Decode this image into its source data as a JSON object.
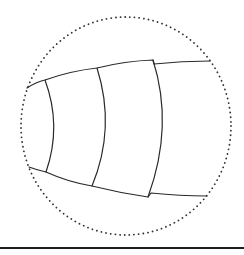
{
  "figure": {
    "stroke_color": "#2a2a2a",
    "dotted_color": "#333333",
    "background": "#ffffff",
    "magnifier_circle": {
      "cx": 126,
      "cy": 126,
      "rx": 105,
      "ry": 109,
      "style": "dotted"
    },
    "segments": [
      {
        "id": 1,
        "top_joint": [
          45,
          80
        ],
        "bottom_joint": [
          46,
          172
        ],
        "bulge_x": 55
      },
      {
        "id": 2,
        "top_joint": [
          97,
          68
        ],
        "bottom_joint": [
          92,
          186
        ],
        "bulge_x": 106
      },
      {
        "id": 3,
        "top_joint": [
          153,
          60
        ],
        "bottom_joint": [
          148,
          197
        ],
        "bulge_x": 163
      }
    ],
    "outline": {
      "top_start": [
        27,
        88
      ],
      "top_end": [
        210,
        61
      ],
      "bottom_start": [
        29,
        167
      ],
      "bottom_end": [
        207,
        196
      ]
    }
  },
  "rule": {
    "y": 248,
    "color": "#1e1e1e",
    "thickness": 2
  }
}
